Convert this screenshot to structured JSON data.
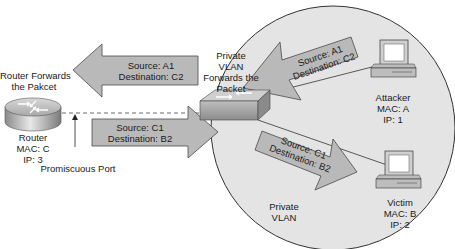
{
  "router": {
    "caption": [
      "Router Forwards",
      "the Pakcet"
    ],
    "labels": [
      "Router",
      "MAC: C",
      "IP: 3"
    ]
  },
  "promiscuous_port": {
    "label": "Promiscuous Port"
  },
  "switch": {
    "caption": [
      "Private",
      "VLAN",
      "Forwards the",
      "Packet"
    ]
  },
  "arrows": [
    {
      "id": "switch-to-router",
      "source": "Source: A1",
      "destination": "Destination: C2",
      "direction": "left"
    },
    {
      "id": "router-to-switch",
      "source": "Source: C1",
      "destination": "Destination: B2",
      "direction": "right"
    },
    {
      "id": "attacker-to-switch",
      "source": "Source: A1",
      "destination": "Destination: C2",
      "direction": "left"
    },
    {
      "id": "switch-to-victim",
      "source": "Source: C1",
      "destination": "Destination: B2",
      "direction": "right"
    }
  ],
  "attacker": {
    "labels": [
      "Attacker",
      "MAC: A",
      "IP: 1"
    ]
  },
  "victim": {
    "labels": [
      "Victim",
      "MAC: B",
      "IP: 2"
    ]
  },
  "private_vlan": {
    "labels": [
      "Private",
      "VLAN"
    ]
  },
  "colors": {
    "vlan_circle": "#e4e4e4",
    "arrow_fill": "#b9b9b9",
    "arrow_stroke": "#4a4a4a",
    "device_body": "#cfcfcf"
  }
}
